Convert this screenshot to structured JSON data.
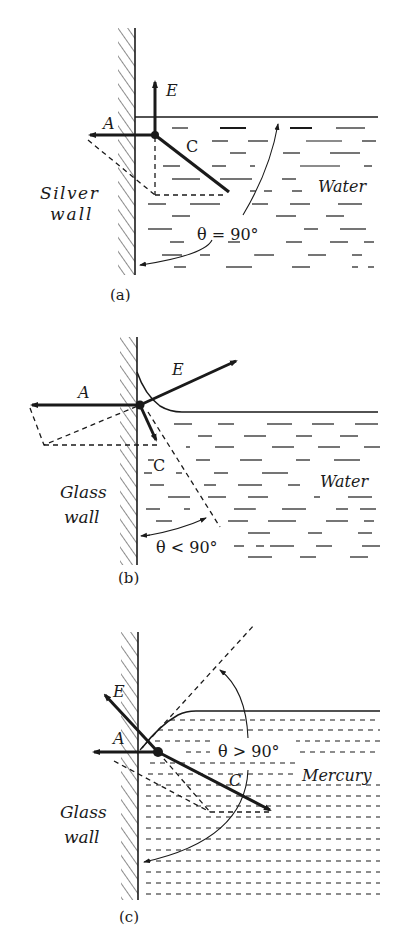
{
  "figure": {
    "panels": [
      {
        "id": "a",
        "caption": "(a)",
        "wall_label_line1": "Silver",
        "wall_label_line2": "wall",
        "liquid_label": "Water",
        "angle_label": "θ = 90°",
        "vectors": {
          "E": "E",
          "A": "A",
          "C": "C"
        }
      },
      {
        "id": "b",
        "caption": "(b)",
        "wall_label_line1": "Glass",
        "wall_label_line2": "wall",
        "liquid_label": "Water",
        "angle_label": "θ < 90°",
        "vectors": {
          "E": "E",
          "A": "A",
          "C": "C"
        }
      },
      {
        "id": "c",
        "caption": "(c)",
        "wall_label_line1": "Glass",
        "wall_label_line2": "wall",
        "liquid_label": "Mercury",
        "angle_label": "θ > 90°",
        "vectors": {
          "E": "E",
          "A": "A",
          "C": "C"
        }
      }
    ]
  },
  "colors": {
    "ink": "#1a1a1a",
    "background": "#ffffff"
  }
}
